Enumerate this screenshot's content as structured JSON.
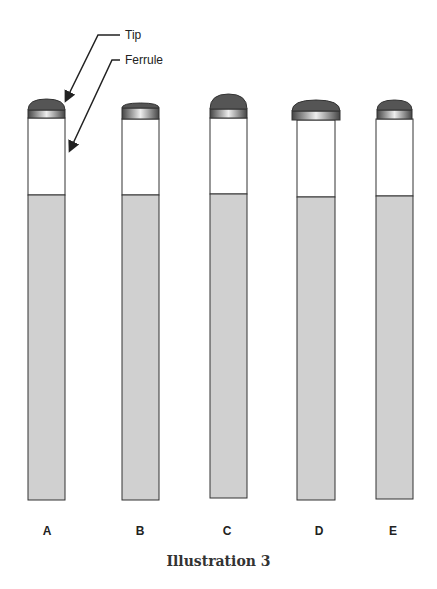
{
  "callouts": {
    "tip": "Tip",
    "ferrule": "Ferrule"
  },
  "sticks": [
    {
      "label": "A"
    },
    {
      "label": "B"
    },
    {
      "label": "C"
    },
    {
      "label": "D"
    },
    {
      "label": "E"
    }
  ],
  "caption": "Illustration 3",
  "colors": {
    "tip": "#555555",
    "shaft": "#d0d0d0",
    "outline": "#333333"
  }
}
